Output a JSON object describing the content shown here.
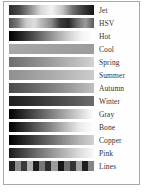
{
  "figure": {
    "title": "",
    "border_color": "#a8a8a8",
    "background": "#fefefe"
  },
  "chart_data": {
    "type": "heatmap",
    "title": "",
    "subtitle": "",
    "xlabel": "",
    "ylabel": "",
    "legend_position": "right",
    "grid": false,
    "categories": [
      "Jet",
      "HSV",
      "Hot",
      "Cool",
      "Spring",
      "Summer",
      "Autumn",
      "Winter",
      "Gray",
      "Bone",
      "Copper",
      "Pink",
      "Lines"
    ],
    "colormaps": [
      {
        "name": "Jet",
        "kind": "continuous",
        "stops": [
          "#2b2b2b",
          "#4a4a4a",
          "#8f8f8f",
          "#d8d8d8",
          "#f2f2f2",
          "#c8c8c8",
          "#707070",
          "#3a3a3a",
          "#141414"
        ],
        "gray_profile": [
          0.17,
          0.29,
          0.56,
          0.85,
          0.95,
          0.78,
          0.44,
          0.23,
          0.08
        ]
      },
      {
        "name": "HSV",
        "kind": "continuous",
        "stops": [
          "#4e4e4e",
          "#7a7a7a",
          "#c9c9c9",
          "#dedede",
          "#b0b0b0",
          "#8a8a8a",
          "#3c3c3c",
          "#262626",
          "#6a6a6a",
          "#9a9a9a",
          "#5a5a5a"
        ],
        "gray_profile": [
          0.31,
          0.48,
          0.79,
          0.87,
          0.69,
          0.54,
          0.24,
          0.15,
          0.42,
          0.6,
          0.35
        ]
      },
      {
        "name": "Hot",
        "kind": "continuous",
        "stops": [
          "#000000",
          "#232323",
          "#4e4e4e",
          "#7d7d7d",
          "#aaaaaa",
          "#d4d4d4",
          "#f4f4f4",
          "#ffffff"
        ],
        "gray_profile": [
          0.0,
          0.14,
          0.31,
          0.49,
          0.67,
          0.83,
          0.96,
          1.0
        ]
      },
      {
        "name": "Cool",
        "kind": "continuous",
        "stops": [
          "#a8a8a8",
          "#a5a5a5",
          "#a2a2a2",
          "#a0a0a0",
          "#9e9e9e",
          "#9c9c9c"
        ],
        "gray_profile": [
          0.66,
          0.65,
          0.64,
          0.63,
          0.62,
          0.61
        ]
      },
      {
        "name": "Spring",
        "kind": "continuous",
        "stops": [
          "#6e6e6e",
          "#808080",
          "#949494",
          "#a8a8a8",
          "#bdbdbd",
          "#d2d2d2"
        ],
        "gray_profile": [
          0.43,
          0.5,
          0.58,
          0.66,
          0.74,
          0.82
        ]
      },
      {
        "name": "Summer",
        "kind": "continuous",
        "stops": [
          "#8f8f8f",
          "#9a9a9a",
          "#a6a6a6",
          "#b2b2b2",
          "#bfbfbf",
          "#cccccc"
        ],
        "gray_profile": [
          0.56,
          0.6,
          0.65,
          0.7,
          0.75,
          0.8
        ]
      },
      {
        "name": "Autumn",
        "kind": "continuous",
        "stops": [
          "#4a4a4a",
          "#5e5e5e",
          "#747474",
          "#8c8c8c",
          "#a6a6a6",
          "#c0c0c0"
        ],
        "gray_profile": [
          0.29,
          0.37,
          0.45,
          0.55,
          0.65,
          0.75
        ]
      },
      {
        "name": "Winter",
        "kind": "continuous",
        "stops": [
          "#1e1e1e",
          "#2b2b2b",
          "#3a3a3a",
          "#4a4a4a",
          "#5a5a5a",
          "#6b6b6b"
        ],
        "gray_profile": [
          0.12,
          0.17,
          0.23,
          0.29,
          0.35,
          0.42
        ]
      },
      {
        "name": "Gray",
        "kind": "continuous",
        "stops": [
          "#000000",
          "#333333",
          "#666666",
          "#999999",
          "#cccccc",
          "#ffffff"
        ],
        "gray_profile": [
          0.0,
          0.2,
          0.4,
          0.6,
          0.8,
          1.0
        ]
      },
      {
        "name": "Bone",
        "kind": "continuous",
        "stops": [
          "#000000",
          "#2e2e2e",
          "#5c5c5c",
          "#8a8a8a",
          "#bcbcbc",
          "#ebebeb",
          "#ffffff"
        ],
        "gray_profile": [
          0.0,
          0.18,
          0.36,
          0.54,
          0.74,
          0.92,
          1.0
        ]
      },
      {
        "name": "Copper",
        "kind": "continuous",
        "stops": [
          "#000000",
          "#242424",
          "#494949",
          "#6d6d6d",
          "#929292",
          "#b6b6b6",
          "#d2d2d2"
        ],
        "gray_profile": [
          0.0,
          0.14,
          0.29,
          0.43,
          0.57,
          0.71,
          0.82
        ]
      },
      {
        "name": "Pink",
        "kind": "continuous",
        "stops": [
          "#1a1a1a",
          "#454545",
          "#6e6e6e",
          "#949494",
          "#b8b8b8",
          "#dcdcdc",
          "#fafafa"
        ],
        "gray_profile": [
          0.1,
          0.27,
          0.43,
          0.58,
          0.72,
          0.86,
          0.98
        ]
      },
      {
        "name": "Lines",
        "kind": "discrete",
        "bands": [
          "#242424",
          "#8c8c8c",
          "#3a3a3a",
          "#b0b0b0",
          "#1c1c1c",
          "#787878",
          "#2e2e2e",
          "#9c9c9c",
          "#161616",
          "#6e6e6e",
          "#343434",
          "#a4a4a4",
          "#202020",
          "#848484"
        ],
        "band_count": 14
      }
    ]
  }
}
